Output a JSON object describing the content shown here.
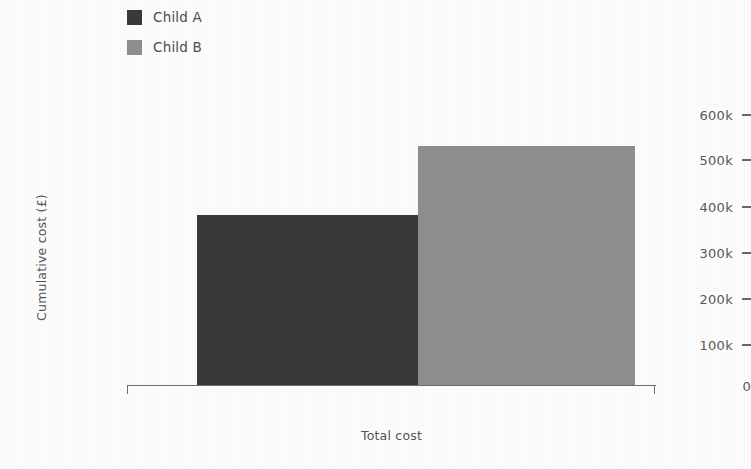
{
  "chart_data": {
    "type": "bar",
    "title": "",
    "subtitle": "",
    "xlabel": "Total cost",
    "ylabel": "Cumulative cost (£)",
    "categories": [
      "Total cost"
    ],
    "series": [
      {
        "name": "Child A",
        "values": [
          378000
        ],
        "color": "#3a3a3a"
      },
      {
        "name": "Child B",
        "values": [
          532000
        ],
        "color": "#8f8f8f"
      }
    ],
    "ylim": [
      0,
      620000
    ],
    "yticks": [
      0,
      100000,
      200000,
      300000,
      400000,
      500000,
      600000
    ],
    "ytick_labels": [
      "0",
      "100k",
      "200k",
      "300k",
      "400k",
      "500k",
      "600k"
    ],
    "grid": false,
    "legend_position": "top-left",
    "bar_layout": "adjacent-no-gap"
  },
  "legend": {
    "items": [
      {
        "label": "Child A",
        "color": "#3a3a3a"
      },
      {
        "label": "Child B",
        "color": "#8f8f8f"
      }
    ]
  },
  "axes": {
    "y_title": "Cumulative cost (£)",
    "x_title": "Total cost",
    "y_tick_labels": [
      "600k",
      "500k",
      "400k",
      "300k",
      "200k",
      "100k",
      "0"
    ],
    "axis_color": "#6f6f6f",
    "text_color": "#5a5a5a"
  },
  "bars": [
    {
      "name": "Child A",
      "value_label": "378k"
    },
    {
      "name": "Child B",
      "value_label": "532k"
    }
  ]
}
